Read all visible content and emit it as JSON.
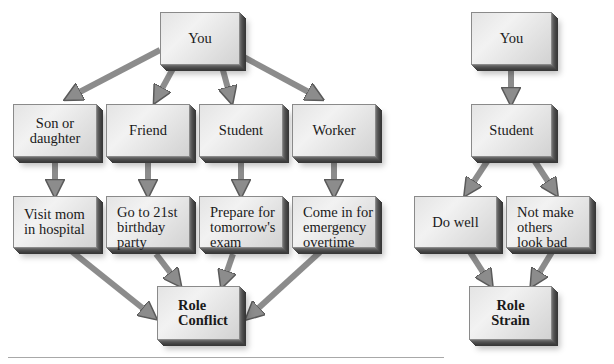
{
  "diagrams": [
    {
      "id": "role-conflict",
      "root": "You",
      "roles": [
        "Son or\ndaughter",
        "Friend",
        "Student",
        "Worker"
      ],
      "expectations": [
        "Visit mom\nin hospital",
        "Go to 21st\nbirthday\nparty",
        "Prepare for\ntomorrow's\nexam",
        "Come in for\nemergency\novertime"
      ],
      "result": "Role\nConflict"
    },
    {
      "id": "role-strain",
      "root": "You",
      "role": "Student",
      "expectations": [
        "Do well",
        "Not make\nothers\nlook bad"
      ],
      "result": "Role\nStrain"
    }
  ],
  "colors": {
    "box_face": "#e8e8e8",
    "box_side": "#3d3d3d",
    "arrow": "#8c8c8c",
    "arrow_outline": "#5a5a5a",
    "divider": "#a8a8a8"
  }
}
